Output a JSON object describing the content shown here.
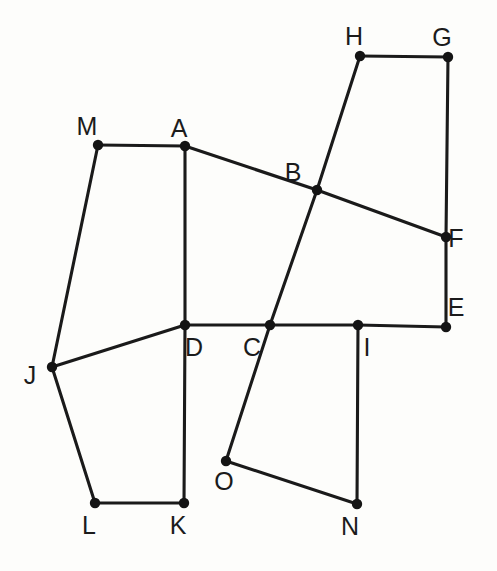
{
  "figure": {
    "background_color": "#fdfdfb",
    "stroke_color": "#1a1a1a",
    "vertex_color": "#141414",
    "width": 497,
    "height": 571
  },
  "chart_data": {
    "type": "scatter",
    "title": "",
    "xlabel": "",
    "ylabel": "",
    "xlim": [
      0,
      497
    ],
    "ylim": [
      571,
      0
    ],
    "grid": false,
    "legend": null,
    "labels": [
      "A",
      "B",
      "C",
      "D",
      "E",
      "F",
      "G",
      "H",
      "I",
      "J",
      "K",
      "L",
      "M",
      "N",
      "O"
    ],
    "x": [
      185,
      317,
      270,
      185,
      446,
      446,
      448,
      360,
      358,
      52,
      184,
      95,
      98,
      357,
      226
    ],
    "y": [
      146,
      190,
      325,
      325,
      327,
      237,
      57,
      56,
      325,
      367,
      503,
      503,
      145,
      504,
      461
    ],
    "points": [
      {
        "label": "A",
        "x": 185,
        "y": 146,
        "label_dx": -6,
        "label_dy": -30
      },
      {
        "label": "B",
        "x": 317,
        "y": 190,
        "label_dx": -24,
        "label_dy": -30
      },
      {
        "label": "C",
        "x": 270,
        "y": 325,
        "label_dx": -18,
        "label_dy": 10
      },
      {
        "label": "D",
        "x": 185,
        "y": 325,
        "label_dx": 9,
        "label_dy": 10
      },
      {
        "label": "E",
        "x": 446,
        "y": 327,
        "label_dx": 10,
        "label_dy": -32
      },
      {
        "label": "F",
        "x": 446,
        "y": 237,
        "label_dx": 10,
        "label_dy": -11
      },
      {
        "label": "G",
        "x": 448,
        "y": 57,
        "label_dx": -6,
        "label_dy": -32
      },
      {
        "label": "H",
        "x": 360,
        "y": 56,
        "label_dx": -6,
        "label_dy": -32
      },
      {
        "label": "I",
        "x": 358,
        "y": 325,
        "label_dx": 9,
        "label_dy": 10
      },
      {
        "label": "J",
        "x": 52,
        "y": 367,
        "label_dx": -22,
        "label_dy": -4
      },
      {
        "label": "K",
        "x": 184,
        "y": 503,
        "label_dx": -6,
        "label_dy": 10
      },
      {
        "label": "L",
        "x": 95,
        "y": 503,
        "label_dx": -6,
        "label_dy": 10
      },
      {
        "label": "M",
        "x": 98,
        "y": 145,
        "label_dx": -11,
        "label_dy": -31
      },
      {
        "label": "N",
        "x": 357,
        "y": 504,
        "label_dx": -7,
        "label_dy": 10
      },
      {
        "label": "O",
        "x": 226,
        "y": 461,
        "label_dx": -2,
        "label_dy": 8
      }
    ],
    "segments": [
      {
        "name": "H-G",
        "from": "H",
        "to": "G"
      },
      {
        "name": "G-F",
        "from": "G",
        "to": "F"
      },
      {
        "name": "F-E",
        "from": "F",
        "to": "E"
      },
      {
        "name": "H-B",
        "from": "H",
        "to": "B"
      },
      {
        "name": "B-C",
        "from": "B",
        "to": "C"
      },
      {
        "name": "C-O",
        "from": "C",
        "to": "O"
      },
      {
        "name": "A-B",
        "from": "A",
        "to": "B"
      },
      {
        "name": "B-F",
        "from": "B",
        "to": "F"
      },
      {
        "name": "M-A",
        "from": "M",
        "to": "A"
      },
      {
        "name": "A-D",
        "from": "A",
        "to": "D"
      },
      {
        "name": "D-K",
        "from": "D",
        "to": "K"
      },
      {
        "name": "M-J",
        "from": "M",
        "to": "J"
      },
      {
        "name": "J-D",
        "from": "J",
        "to": "D"
      },
      {
        "name": "J-L",
        "from": "J",
        "to": "L"
      },
      {
        "name": "L-K",
        "from": "L",
        "to": "K"
      },
      {
        "name": "D-C",
        "from": "D",
        "to": "C"
      },
      {
        "name": "C-I",
        "from": "C",
        "to": "I"
      },
      {
        "name": "I-E",
        "from": "I",
        "to": "E"
      },
      {
        "name": "I-N",
        "from": "I",
        "to": "N"
      },
      {
        "name": "O-N",
        "from": "O",
        "to": "N"
      }
    ],
    "polylines": [
      {
        "name": "hub-chain",
        "labels": [
          "H",
          "B",
          "C",
          "O"
        ]
      },
      {
        "name": "abf-chain",
        "labels": [
          "A",
          "B",
          "F"
        ]
      },
      {
        "name": "gfe-chain",
        "labels": [
          "G",
          "F",
          "E"
        ]
      },
      {
        "name": "adk-chain",
        "labels": [
          "A",
          "D",
          "K"
        ]
      },
      {
        "name": "dcie-chain",
        "labels": [
          "D",
          "C",
          "I",
          "E"
        ]
      },
      {
        "name": "majlk-chain",
        "labels": [
          "M",
          "A"
        ]
      },
      {
        "name": "mjl-chain",
        "labels": [
          "M",
          "J",
          "L",
          "K"
        ]
      },
      {
        "name": "jd-chain",
        "labels": [
          "J",
          "D"
        ]
      },
      {
        "name": "hg-chain",
        "labels": [
          "H",
          "G"
        ]
      },
      {
        "name": "ino-chain",
        "labels": [
          "I",
          "N",
          "O"
        ]
      }
    ],
    "vertex_radius": 5.2
  }
}
